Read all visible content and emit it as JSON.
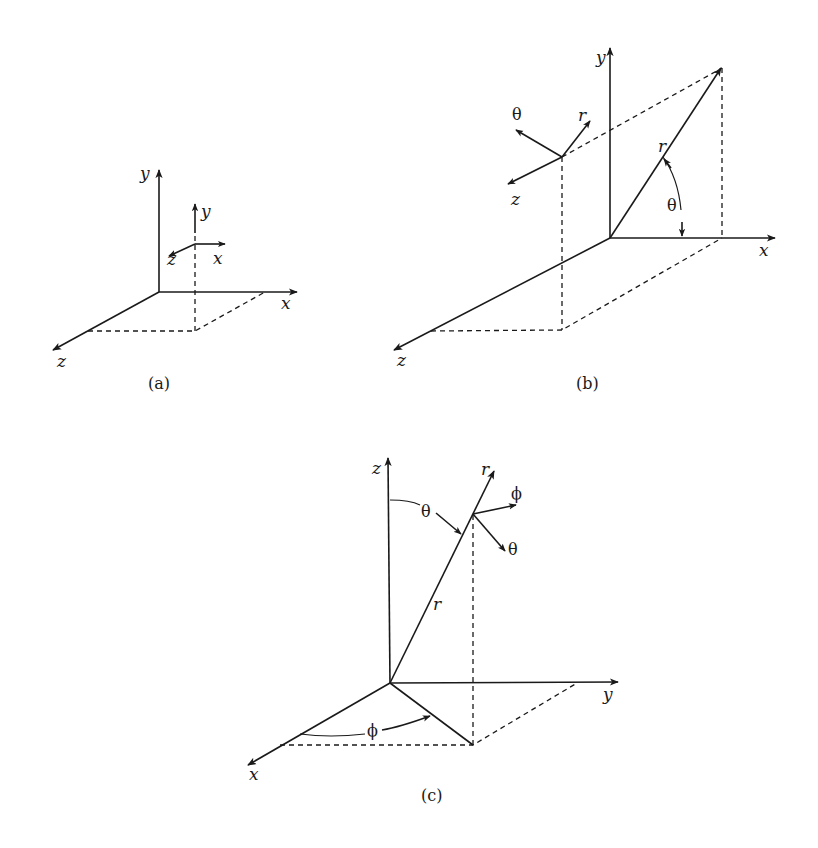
{
  "figure": {
    "colors": {
      "line": "#1a1a1a",
      "background": "#ffffff"
    },
    "panels": [
      {
        "caption": "(a)",
        "system": "cartesian",
        "axes": {
          "y": "y",
          "x": "x",
          "z": "z"
        },
        "local_frame": {
          "y": "y",
          "x": "x",
          "z": "z"
        }
      },
      {
        "caption": "(b)",
        "system": "cylindrical",
        "axes": {
          "y": "y",
          "x": "x",
          "z": "z"
        },
        "vector_label": "r",
        "angle_label": "θ",
        "local_frame": {
          "theta": "θ",
          "r": "r",
          "z": "z"
        }
      },
      {
        "caption": "(c)",
        "system": "spherical",
        "axes": {
          "z": "z",
          "y": "y",
          "x": "x"
        },
        "vector_label": "r",
        "polar_angle_label": "θ",
        "azimuth_angle_label": "ϕ",
        "local_frame": {
          "r": "r",
          "phi": "ϕ",
          "theta": "θ"
        }
      }
    ]
  }
}
